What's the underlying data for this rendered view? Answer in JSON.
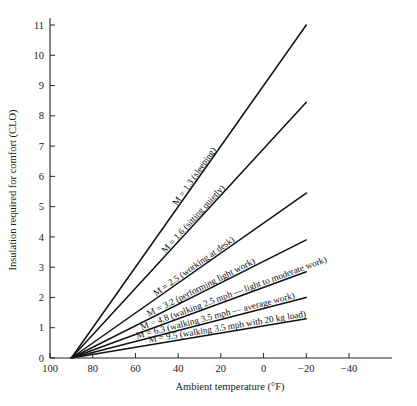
{
  "chart_data": {
    "type": "line",
    "title": "",
    "xlabel": "Ambient temperature (°F)",
    "ylabel": "Insulation required for comfort (CLO)",
    "xlim": [
      105,
      -52
    ],
    "ylim": [
      0,
      11.4
    ],
    "x_ticks": [
      100,
      80,
      60,
      40,
      20,
      0,
      -20,
      -40
    ],
    "x_tick_labels": [
      "100",
      "80",
      "60",
      "40",
      "20",
      "0",
      "−20",
      "−40"
    ],
    "y_ticks": [
      0,
      1,
      2,
      3,
      4,
      5,
      6,
      7,
      8,
      9,
      10,
      11
    ],
    "y_tick_labels": [
      "0",
      "1",
      "2",
      "3",
      "4",
      "5",
      "6",
      "7",
      "8",
      "9",
      "10",
      "11"
    ],
    "grid": false,
    "legend_position": "inline-annotations",
    "x_axis_direction": "descending",
    "common_origin": {
      "x": 90,
      "y": 0
    },
    "series": [
      {
        "name": "M = 1.3 (sleeping)",
        "metabolic_rate": 1.3,
        "label": "M = 1.3 (sleeping)",
        "x": [
          90,
          -20
        ],
        "values": [
          0,
          11.0
        ]
      },
      {
        "name": "M = 1.6 (sitting quietly)",
        "metabolic_rate": 1.6,
        "label": "M = 1.6 (sitting quietly)",
        "x": [
          90,
          -20
        ],
        "values": [
          0,
          8.45
        ]
      },
      {
        "name": "M = 2.5 (working at desk)",
        "metabolic_rate": 2.5,
        "label": "M = 2.5 (working at desk)",
        "x": [
          90,
          -20
        ],
        "values": [
          0,
          5.45
        ]
      },
      {
        "name": "M = 3.2 (performing light work)",
        "metabolic_rate": 3.2,
        "label": "M = 3.2 (performing light work)",
        "x": [
          90,
          -20
        ],
        "values": [
          0,
          3.9
        ]
      },
      {
        "name": "M = 4.8 (walking 2.5 mph — light to moderate work)",
        "metabolic_rate": 4.8,
        "label": "M = 4.8 (walking 2.5 mph — light to moderate work)",
        "x": [
          90,
          -20
        ],
        "values": [
          0,
          2.85
        ]
      },
      {
        "name": "M = 6.3 (walking 3.5 mph — average work)",
        "metabolic_rate": 6.3,
        "label": "M = 6.3 (walking 3.5 mph — average work)",
        "x": [
          90,
          -20
        ],
        "values": [
          0,
          2.0
        ]
      },
      {
        "name": "M = 9.5 (walking 3.5 mph with 20 kg load)",
        "metabolic_rate": 9.5,
        "label": "M = 9.5 (walking 3.5 mph with 20 kg load)",
        "x": [
          90,
          -20
        ],
        "values": [
          0,
          1.3
        ]
      }
    ],
    "colors": {
      "line": "#111111",
      "axis": "#262626",
      "text": "#1a1a1a",
      "background": "#ffffff"
    }
  }
}
